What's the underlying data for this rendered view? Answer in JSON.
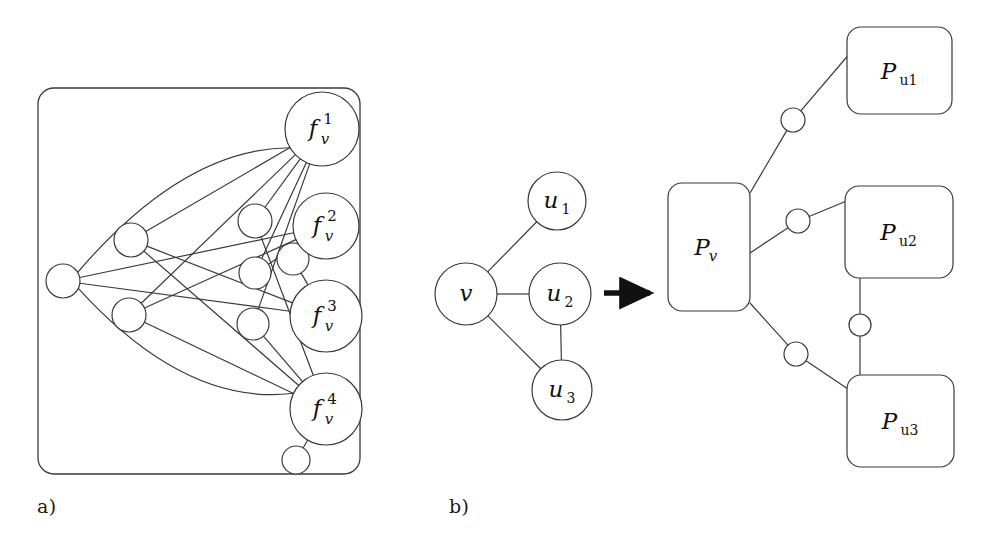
{
  "figure": {
    "type": "diagram",
    "panels": [
      {
        "id": "a",
        "caption": "a)",
        "description": "Bipartite-like gadget graph inside a rounded rectangle frame",
        "container": {
          "x": 38,
          "y": 88,
          "width": 322,
          "height": 386,
          "rx": 16
        },
        "big_nodes": [
          {
            "id": "f1",
            "base": "f",
            "sup": "1",
            "sub": "v",
            "cx": 322,
            "cy": 129,
            "r": 37
          },
          {
            "id": "f2",
            "base": "f",
            "sup": "2",
            "sub": "v",
            "cx": 326,
            "cy": 226,
            "r": 33
          },
          {
            "id": "f3",
            "base": "f",
            "sup": "3",
            "sub": "v",
            "cx": 326,
            "cy": 316,
            "r": 36
          },
          {
            "id": "f4",
            "base": "f",
            "sup": "4",
            "sub": "v",
            "cx": 326,
            "cy": 409,
            "r": 36
          }
        ],
        "small_nodes": [
          {
            "id": "s0",
            "cx": 63,
            "cy": 281,
            "r": 17
          },
          {
            "id": "s1",
            "cx": 131,
            "cy": 240,
            "r": 17
          },
          {
            "id": "s2",
            "cx": 129,
            "cy": 315,
            "r": 17
          },
          {
            "id": "s3",
            "cx": 255,
            "cy": 221,
            "r": 17
          },
          {
            "id": "s4",
            "cx": 255,
            "cy": 273,
            "r": 16
          },
          {
            "id": "s5",
            "cx": 293,
            "cy": 259,
            "r": 16
          },
          {
            "id": "s6",
            "cx": 253,
            "cy": 324,
            "r": 16
          },
          {
            "id": "s7",
            "cx": 296,
            "cy": 460,
            "r": 14
          }
        ],
        "edges": [
          {
            "from": "s0",
            "to": "f1",
            "curve": "arc-up"
          },
          {
            "from": "s0",
            "to": "f4",
            "curve": "arc-down"
          },
          {
            "from": "s0",
            "to": "f2",
            "curve": "straight"
          },
          {
            "from": "s0",
            "to": "f3",
            "curve": "straight"
          },
          {
            "from": "s1",
            "to": "f1",
            "curve": "straight"
          },
          {
            "from": "s1",
            "to": "f3",
            "curve": "straight"
          },
          {
            "from": "s1",
            "to": "f4",
            "curve": "straight"
          },
          {
            "from": "s2",
            "to": "f1",
            "curve": "straight"
          },
          {
            "from": "s2",
            "to": "f2",
            "curve": "straight"
          },
          {
            "from": "s2",
            "to": "f4",
            "curve": "straight"
          },
          {
            "from": "s3",
            "to": "f1",
            "curve": "straight"
          },
          {
            "from": "s3",
            "to": "f4",
            "curve": "straight"
          },
          {
            "from": "s4",
            "to": "f1",
            "curve": "straight"
          },
          {
            "from": "s4",
            "to": "f2",
            "curve": "straight"
          },
          {
            "from": "s5",
            "to": "f2",
            "curve": "straight"
          },
          {
            "from": "s5",
            "to": "f3",
            "curve": "straight"
          },
          {
            "from": "s6",
            "to": "f1",
            "curve": "straight"
          },
          {
            "from": "s6",
            "to": "f4",
            "curve": "straight"
          },
          {
            "from": "s7",
            "to": "f4",
            "curve": "straight"
          }
        ]
      },
      {
        "id": "b",
        "caption": "b)",
        "description": "Graph transformation: node v with neighbours u1,u2,u3 maps to gadget boxes Pv, Pu1, Pu2, Pu3",
        "arrow": {
          "x1": 604,
          "y1": 293,
          "x2": 657,
          "y2": 293,
          "label": "transforms-to"
        },
        "left_graph": {
          "nodes": [
            {
              "id": "v",
              "label": "v",
              "sub": "",
              "cx": 466,
              "cy": 294,
              "r": 31
            },
            {
              "id": "u1",
              "label": "u",
              "sub": "1",
              "cx": 557,
              "cy": 201,
              "r": 29
            },
            {
              "id": "u2",
              "label": "u",
              "sub": "2",
              "cx": 560,
              "cy": 294,
              "r": 31
            },
            {
              "id": "u3",
              "label": "u",
              "sub": "3",
              "cx": 562,
              "cy": 390,
              "r": 30
            }
          ],
          "edges": [
            {
              "from": "v",
              "to": "u1"
            },
            {
              "from": "v",
              "to": "u2"
            },
            {
              "from": "v",
              "to": "u3"
            },
            {
              "from": "u2",
              "to": "u3"
            }
          ]
        },
        "right_graph": {
          "boxes": [
            {
              "id": "Pv",
              "base": "P",
              "sub": "v",
              "x": 668,
              "y": 183,
              "width": 82,
              "height": 128,
              "rx": 14
            },
            {
              "id": "Pu1",
              "base": "P",
              "sub": "u1",
              "x": 847,
              "y": 27,
              "width": 105,
              "height": 87,
              "rx": 14
            },
            {
              "id": "Pu2",
              "base": "P",
              "sub": "u2",
              "x": 845,
              "y": 186,
              "width": 108,
              "height": 92,
              "rx": 14
            },
            {
              "id": "Pu3",
              "base": "P",
              "sub": "u3",
              "x": 847,
              "y": 375,
              "width": 107,
              "height": 92,
              "rx": 14
            }
          ],
          "connectors": [
            {
              "id": "c1",
              "cx": 793,
              "cy": 120,
              "r": 12,
              "between": [
                "Pv",
                "Pu1"
              ]
            },
            {
              "id": "c2",
              "cx": 798,
              "cy": 221,
              "r": 12,
              "between": [
                "Pv",
                "Pu2"
              ]
            },
            {
              "id": "c3",
              "cx": 796,
              "cy": 354,
              "r": 12,
              "between": [
                "Pv",
                "Pu3"
              ]
            },
            {
              "id": "c4",
              "cx": 860,
              "cy": 325,
              "r": 11,
              "between": [
                "Pu2",
                "Pu3"
              ]
            }
          ]
        }
      }
    ]
  },
  "style": {
    "stroke": "#3a3a3a",
    "text": "#111111",
    "background": "#ffffff",
    "stroke_width": "1.2"
  }
}
